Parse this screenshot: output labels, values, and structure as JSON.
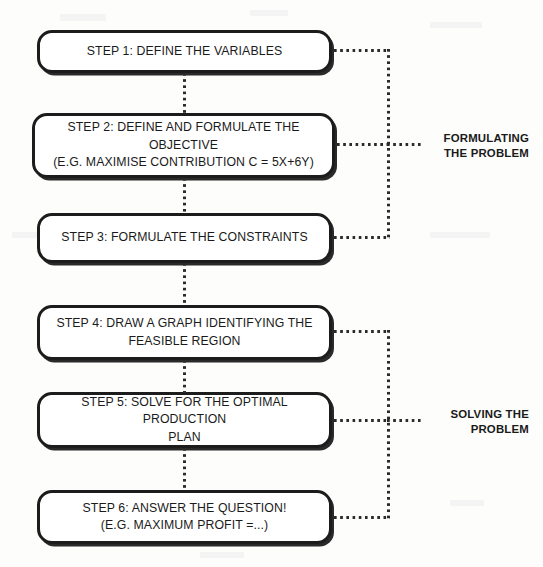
{
  "diagram": {
    "colors": {
      "background": "#fdfdfc",
      "box_fill": "#ffffff",
      "box_border": "#1c1c1c",
      "text": "#1a1a1a",
      "connector": "#2b2b2b"
    },
    "steps": [
      {
        "id": "step-1",
        "line1": "STEP 1: DEFINE THE VARIABLES",
        "line2": ""
      },
      {
        "id": "step-2",
        "line1": "STEP 2: DEFINE AND FORMULATE THE OBJECTIVE",
        "line2": "(E.G. MAXIMISE CONTRIBUTION C = 5X+6Y)"
      },
      {
        "id": "step-3",
        "line1": "STEP 3: FORMULATE THE CONSTRAINTS",
        "line2": ""
      },
      {
        "id": "step-4",
        "line1": "STEP 4: DRAW A GRAPH IDENTIFYING THE",
        "line2": "FEASIBLE REGION"
      },
      {
        "id": "step-5",
        "line1": "STEP 5: SOLVE FOR THE OPTIMAL PRODUCTION",
        "line2": "PLAN"
      },
      {
        "id": "step-6",
        "line1": "STEP 6: ANSWER THE QUESTION!",
        "line2": "(E.G. MAXIMUM PROFIT =...)"
      }
    ],
    "groups": [
      {
        "id": "group-formulating",
        "line1": "FORMULATING",
        "line2": "THE PROBLEM",
        "covers": [
          "step-1",
          "step-2",
          "step-3"
        ]
      },
      {
        "id": "group-solving",
        "line1": "SOLVING THE",
        "line2": "PROBLEM",
        "covers": [
          "step-4",
          "step-5",
          "step-6"
        ]
      }
    ]
  }
}
